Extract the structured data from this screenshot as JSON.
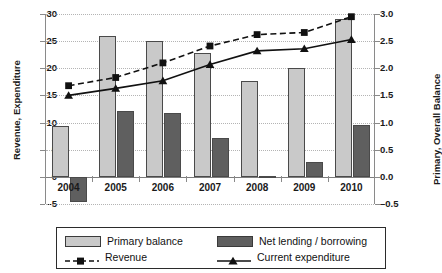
{
  "chart_data": {
    "type": "bar",
    "title": "",
    "xlabel": "",
    "ylabel": "Revenue, Expenditure",
    "y2label": "Primary, Overall Balance",
    "categories": [
      "2004",
      "2005",
      "2006",
      "2007",
      "2008",
      "2009",
      "2010"
    ],
    "ylim": [
      -5,
      30
    ],
    "yticks": [
      "30",
      "25",
      "20",
      "15",
      "10",
      "5",
      "0",
      "-5"
    ],
    "y2lim": [
      -0.5,
      3.0
    ],
    "y2ticks": [
      "3.0",
      "2.5",
      "2.0",
      "1.5",
      "1.0",
      "0.5",
      "0.0",
      "-0.5"
    ],
    "grid": true,
    "legend_position": "bottom",
    "series": [
      {
        "name": "Primary balance",
        "kind": "bar",
        "axis": "right",
        "color": "#c9c9c9",
        "values": [
          0.93,
          2.59,
          2.5,
          2.28,
          1.76,
          2.0,
          2.9
        ]
      },
      {
        "name": "Net lending / borrowing",
        "kind": "bar",
        "axis": "right",
        "color": "#5f5f5f",
        "values": [
          -0.46,
          1.22,
          1.18,
          0.71,
          0.02,
          0.27,
          0.96
        ]
      },
      {
        "name": "Revenue",
        "kind": "line-dashed",
        "axis": "left",
        "color": "#111111",
        "marker": "square",
        "values": [
          16.8,
          18.3,
          21.0,
          24.1,
          26.2,
          26.6,
          29.5
        ]
      },
      {
        "name": "Current expenditure",
        "kind": "line-solid",
        "axis": "left",
        "color": "#111111",
        "marker": "triangle",
        "values": [
          15.0,
          16.3,
          17.7,
          20.7,
          23.2,
          23.6,
          25.3
        ]
      }
    ]
  },
  "legend": {
    "items": [
      {
        "label": "Primary balance",
        "glyph": "bar-swatch-light"
      },
      {
        "label": "Net lending / borrowing",
        "glyph": "bar-swatch-dark"
      },
      {
        "label": "Revenue",
        "glyph": "dashed-line-square-marker"
      },
      {
        "label": "Current expenditure",
        "glyph": "solid-line-triangle-marker"
      }
    ]
  }
}
